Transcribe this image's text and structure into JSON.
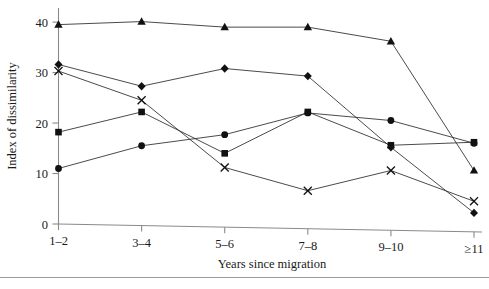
{
  "figure": {
    "caption_fragment": "",
    "background_color": "#ffffff",
    "line_color": "#2b2b2b",
    "axis_color": "#8a8a8a"
  },
  "chart_data": {
    "type": "line",
    "title": "",
    "xlabel": "Years since migration",
    "ylabel": "Index of dissimilarity",
    "categories": [
      "1–2",
      "3–4",
      "5–6",
      "7–8",
      "9–10",
      "≥11"
    ],
    "x": [
      0,
      1,
      2,
      3,
      4,
      5
    ],
    "ylim": [
      0,
      42
    ],
    "yticks": [
      0,
      10,
      20,
      30,
      40
    ],
    "ytick_labels": [
      "0",
      "10",
      "20",
      "30",
      "40"
    ],
    "grid": false,
    "legend": "none",
    "series": [
      {
        "name": "series-triangle",
        "marker": "triangle",
        "values": [
          39.5,
          40.1,
          39.0,
          39.0,
          36.2,
          10.6
        ]
      },
      {
        "name": "series-diamond",
        "marker": "diamond",
        "values": [
          31.6,
          27.3,
          30.8,
          29.3,
          15.2,
          2.2
        ]
      },
      {
        "name": "series-cross",
        "marker": "cross",
        "values": [
          30.3,
          24.5,
          11.2,
          6.6,
          10.6,
          4.5
        ]
      },
      {
        "name": "series-square",
        "marker": "square",
        "values": [
          18.2,
          22.2,
          14.0,
          22.2,
          15.6,
          16.2
        ]
      },
      {
        "name": "series-circle",
        "marker": "circle",
        "values": [
          11.0,
          15.5,
          17.7,
          22.0,
          20.5,
          16.0
        ]
      }
    ]
  }
}
